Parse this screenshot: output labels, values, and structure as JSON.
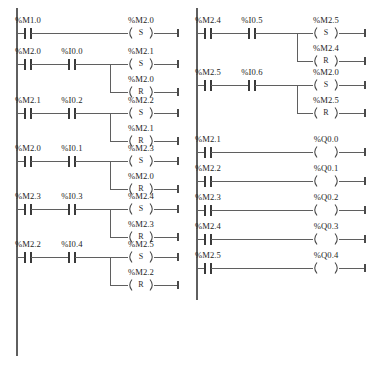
{
  "diagram": {
    "type": "plc-ladder-diagram",
    "colors": {
      "wire": "#5f5f5f",
      "contact": "#3a3a3a",
      "text": "#1d1d1d",
      "background": "#ffffff"
    },
    "symbols": {
      "contact_no": "-| |-",
      "coil_set": "(S)",
      "coil_reset": "(R)",
      "coil_plain": "( )"
    },
    "columns": [
      {
        "id": "left-column",
        "rungs": [
          {
            "id": "rung-l1",
            "contacts": [
              {
                "label": "%M1.0",
                "type": "NO"
              }
            ],
            "outputs": [
              {
                "label": "%M2.0",
                "coil": "S",
                "letter": "S"
              }
            ]
          },
          {
            "id": "rung-l2",
            "contacts": [
              {
                "label": "%M2.0",
                "type": "NO"
              },
              {
                "label": "%I0.0",
                "type": "NO"
              }
            ],
            "outputs": [
              {
                "label": "%M2.1",
                "coil": "S",
                "letter": "S"
              },
              {
                "label": "%M2.0",
                "coil": "R",
                "letter": "R"
              }
            ]
          },
          {
            "id": "rung-l3",
            "contacts": [
              {
                "label": "%M2.1",
                "type": "NO"
              },
              {
                "label": "%I0.2",
                "type": "NO"
              }
            ],
            "outputs": [
              {
                "label": "%M2.2",
                "coil": "S",
                "letter": "S"
              },
              {
                "label": "%M2.1",
                "coil": "R",
                "letter": "R"
              }
            ]
          },
          {
            "id": "rung-l4",
            "contacts": [
              {
                "label": "%M2.0",
                "type": "NO"
              },
              {
                "label": "%I0.1",
                "type": "NO"
              }
            ],
            "outputs": [
              {
                "label": "%M2.3",
                "coil": "S",
                "letter": "S"
              },
              {
                "label": "%M2.0",
                "coil": "R",
                "letter": "R"
              }
            ]
          },
          {
            "id": "rung-l5",
            "contacts": [
              {
                "label": "%M2.3",
                "type": "NO"
              },
              {
                "label": "%I0.3",
                "type": "NO"
              }
            ],
            "outputs": [
              {
                "label": "%M2.4",
                "coil": "S",
                "letter": "S"
              },
              {
                "label": "%M2.3",
                "coil": "R",
                "letter": "R"
              }
            ]
          },
          {
            "id": "rung-l6",
            "contacts": [
              {
                "label": "%M2.2",
                "type": "NO"
              },
              {
                "label": "%I0.4",
                "type": "NO"
              }
            ],
            "outputs": [
              {
                "label": "%M2.5",
                "coil": "S",
                "letter": "S"
              },
              {
                "label": "%M2.2",
                "coil": "R",
                "letter": "R"
              }
            ]
          }
        ]
      },
      {
        "id": "right-column",
        "rungs": [
          {
            "id": "rung-r1",
            "contacts": [
              {
                "label": "%M2.4",
                "type": "NO"
              },
              {
                "label": "%I0.5",
                "type": "NO"
              }
            ],
            "outputs": [
              {
                "label": "%M2.5",
                "coil": "S",
                "letter": "S"
              },
              {
                "label": "%M2.4",
                "coil": "R",
                "letter": "R"
              }
            ]
          },
          {
            "id": "rung-r2",
            "contacts": [
              {
                "label": "%M2.5",
                "type": "NO"
              },
              {
                "label": "%I0.6",
                "type": "NO"
              }
            ],
            "outputs": [
              {
                "label": "%M2.0",
                "coil": "S",
                "letter": "S"
              },
              {
                "label": "%M2.5",
                "coil": "R",
                "letter": "R"
              }
            ]
          },
          {
            "id": "rung-r3",
            "contacts": [
              {
                "label": "%M2.1",
                "type": "NO"
              }
            ],
            "outputs": [
              {
                "label": "%Q0.0",
                "coil": "plain",
                "letter": ""
              }
            ]
          },
          {
            "id": "rung-r4",
            "contacts": [
              {
                "label": "%M2.2",
                "type": "NO"
              }
            ],
            "outputs": [
              {
                "label": "%Q0.1",
                "coil": "plain",
                "letter": ""
              }
            ]
          },
          {
            "id": "rung-r5",
            "contacts": [
              {
                "label": "%M2.3",
                "type": "NO"
              }
            ],
            "outputs": [
              {
                "label": "%Q0.2",
                "coil": "plain",
                "letter": ""
              }
            ]
          },
          {
            "id": "rung-r6",
            "contacts": [
              {
                "label": "%M2.4",
                "type": "NO"
              }
            ],
            "outputs": [
              {
                "label": "%Q0.3",
                "coil": "plain",
                "letter": ""
              }
            ]
          },
          {
            "id": "rung-r7",
            "contacts": [
              {
                "label": "%M2.5",
                "type": "NO"
              }
            ],
            "outputs": [
              {
                "label": "%Q0.4",
                "coil": "plain",
                "letter": ""
              }
            ]
          }
        ]
      }
    ]
  }
}
